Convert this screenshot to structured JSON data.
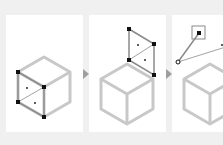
{
  "diagram": {
    "colors": {
      "background": "#f0f0f0",
      "panel": "#ffffff",
      "cube_edge": "#c8c8c8",
      "selected_edge": "#9a9a9a",
      "vertex": "#111111",
      "arrow": "#9e9e9e"
    },
    "panels": [
      {
        "step": 1,
        "description": "Left face of cube selected"
      },
      {
        "step": 2,
        "description": "Selected face moved up above cube"
      },
      {
        "step": 3,
        "description": "Face rotated with vertex handle selected"
      }
    ],
    "arrows": [
      {
        "from": 1,
        "to": 2,
        "icon": "arrow-right-icon"
      },
      {
        "from": 2,
        "to": 3,
        "icon": "arrow-right-icon"
      }
    ]
  }
}
